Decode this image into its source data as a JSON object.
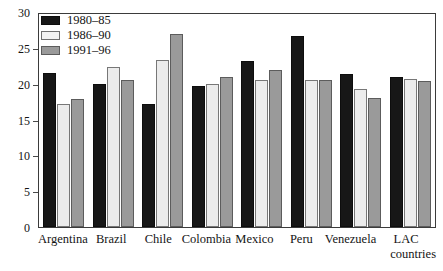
{
  "chart_data": {
    "type": "bar",
    "title": "",
    "xlabel": "",
    "ylabel": "",
    "ylim": [
      0,
      30
    ],
    "yticks": [
      0,
      5,
      10,
      15,
      20,
      25,
      30
    ],
    "grid": false,
    "legend_position": "top-left",
    "categories": [
      "Argentina",
      "Brazil",
      "Chile",
      "Colombia",
      "Mexico",
      "Peru",
      "Venezuela",
      "LAC countries"
    ],
    "series": [
      {
        "name": "1980–85",
        "color": "#171717",
        "values": [
          21.5,
          20.0,
          17.2,
          19.7,
          23.1,
          26.7,
          21.3,
          21.0
        ]
      },
      {
        "name": "1986–90",
        "color": "#ececec",
        "values": [
          17.2,
          22.3,
          23.3,
          20.0,
          20.5,
          20.5,
          19.3,
          20.6
        ]
      },
      {
        "name": "1991–96",
        "color": "#9a9a9a",
        "values": [
          17.8,
          20.5,
          26.9,
          20.9,
          21.9,
          20.5,
          18.0,
          20.4
        ]
      }
    ]
  },
  "axis": {
    "y_labels": [
      "30",
      "25",
      "20",
      "15",
      "10",
      "5",
      "0"
    ]
  },
  "legend": {
    "items": [
      {
        "label": "1980–85"
      },
      {
        "label": "1986–90"
      },
      {
        "label": "1991–96"
      }
    ]
  },
  "xaxis": {
    "labels": [
      {
        "line1": "Argentina",
        "line2": ""
      },
      {
        "line1": "Brazil",
        "line2": ""
      },
      {
        "line1": "Chile",
        "line2": ""
      },
      {
        "line1": "Colombia",
        "line2": ""
      },
      {
        "line1": "Mexico",
        "line2": ""
      },
      {
        "line1": "Peru",
        "line2": ""
      },
      {
        "line1": "Venezuela",
        "line2": ""
      },
      {
        "line1": "LAC",
        "line2": "countries"
      }
    ]
  }
}
